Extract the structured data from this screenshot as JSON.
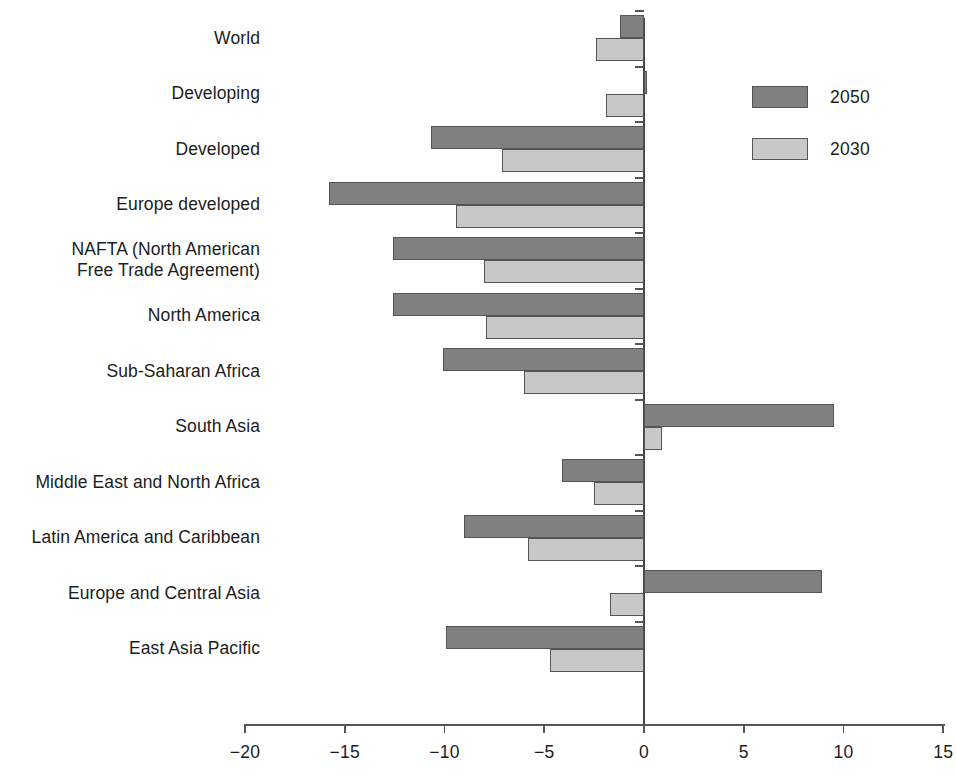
{
  "chart_data": {
    "type": "bar",
    "orientation": "horizontal",
    "title": "",
    "subtitle": "",
    "xlabel": "",
    "ylabel": "",
    "xlim": [
      -20,
      15
    ],
    "xticks": [
      -20,
      -15,
      -10,
      -5,
      0,
      5,
      10,
      15
    ],
    "xtick_labels": [
      "−20",
      "−15",
      "−10",
      "−5",
      "0",
      "5",
      "10",
      "15"
    ],
    "grid": false,
    "legend_position": "top-right",
    "categories": [
      "World",
      "Developing",
      "Developed",
      "Europe developed",
      "NAFTA (North American\nFree Trade Agreement)",
      "North America",
      "Sub-Saharan Africa",
      "South Asia",
      "Middle East and North Africa",
      "Latin America and Caribbean",
      "Europe and Central Asia",
      "East Asia Pacific"
    ],
    "series": [
      {
        "name": "2050",
        "color": "#808080",
        "values": [
          -1.2,
          0.15,
          -10.7,
          -15.8,
          -12.6,
          -12.6,
          -10.1,
          9.5,
          -4.1,
          -9.0,
          8.9,
          -9.9
        ]
      },
      {
        "name": "2030",
        "color": "#c8c8c8",
        "values": [
          -2.4,
          -1.9,
          -7.1,
          -9.4,
          -8.0,
          -7.9,
          -6.0,
          0.9,
          -2.5,
          -5.8,
          -1.7,
          -4.7
        ]
      }
    ]
  },
  "legend": {
    "items": [
      {
        "label": "2050",
        "color": "#808080"
      },
      {
        "label": "2030",
        "color": "#c8c8c8"
      }
    ]
  },
  "colors": {
    "series_2050": "#808080",
    "series_2030": "#c8c8c8",
    "axis": "#555555",
    "text": "#1c1c1c",
    "background": "#ffffff"
  }
}
